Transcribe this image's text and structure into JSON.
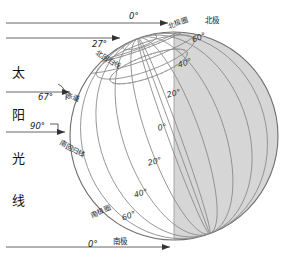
{
  "diagram": {
    "title_text_column": [
      "太",
      "阳",
      "光",
      "线"
    ],
    "sun_rays": {
      "ray_top": {
        "angle_label": "0°",
        "name": "top-ray"
      },
      "ray_arctic": {
        "angle_label": "27°",
        "name": "arctic-ray"
      },
      "ray_equator": {
        "angle_label": "67°",
        "name": "equator-ray"
      },
      "ray_tropic": {
        "angle_label": "90°",
        "name": "tropic-ray"
      },
      "ray_bottom": {
        "angle_label": "0°",
        "name": "bottom-ray"
      }
    },
    "poles": {
      "north": "北极",
      "south": "南极"
    },
    "circles": {
      "arctic_circle": "北极圈",
      "tropic_of_cancer": "北回归线",
      "equator": "赤道",
      "tropic_of_capricorn": "南回归线",
      "antarctic_circle": "南极圈"
    },
    "latitudes": [
      {
        "label": "60°",
        "hemisphere": "north"
      },
      {
        "label": "40°",
        "hemisphere": "north"
      },
      {
        "label": "20°",
        "hemisphere": "north"
      },
      {
        "label": "0°",
        "hemisphere": "equator"
      },
      {
        "label": "20°",
        "hemisphere": "south"
      },
      {
        "label": "40°",
        "hemisphere": "south"
      },
      {
        "label": "60°",
        "hemisphere": "south"
      }
    ],
    "colors": {
      "background": "#ffffff",
      "shadow_fill": "#d6d6d6",
      "lit_fill": "#ffffff",
      "grid_line": "#8a8a8a",
      "outline": "#6f6f6f",
      "ray_line": "#555555",
      "dashed_line": "#9a9a9a",
      "text": "#1a1a1a"
    }
  }
}
